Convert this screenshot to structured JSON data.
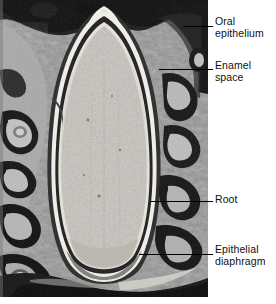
{
  "figure": {
    "type": "histological-micrograph",
    "staining": "grayscale light micrograph",
    "background_color": "#ffffff",
    "text_color": "#111111",
    "leader_color": "#000000"
  },
  "micrograph": {
    "name": "tooth-development-micrograph",
    "width": 208,
    "height": 297,
    "regions": [
      {
        "name": "oral-epithelium",
        "tone": "dark"
      },
      {
        "name": "enamel-space",
        "tone": "light-band"
      },
      {
        "name": "dental-papilla-pulp",
        "tone": "mid-gray-granular"
      },
      {
        "name": "dentin",
        "tone": "dark-band"
      },
      {
        "name": "root",
        "tone": "mid-gray"
      },
      {
        "name": "epithelial-diaphragm",
        "tone": "light"
      },
      {
        "name": "alveolar-bone",
        "tone": "mottled"
      }
    ]
  },
  "annotations": [
    {
      "id": "oral-epithelium",
      "label": "Oral\nepithelium",
      "label_x": 215,
      "label_y": 16,
      "leader_x": 183,
      "leader_y": 26,
      "leader_w": 30
    },
    {
      "id": "enamel-space",
      "label": "Enamel\nspace",
      "label_x": 215,
      "label_y": 60,
      "leader_x": 159,
      "leader_y": 69,
      "leader_w": 54
    },
    {
      "id": "root",
      "label": "Root",
      "label_x": 215,
      "label_y": 194,
      "leader_x": 150,
      "leader_y": 201,
      "leader_w": 63
    },
    {
      "id": "epithelial-diaphragm",
      "label": "Epithelial\ndiaphragm",
      "label_x": 215,
      "label_y": 244,
      "leader_x": 139,
      "leader_y": 254,
      "leader_w": 74
    }
  ]
}
